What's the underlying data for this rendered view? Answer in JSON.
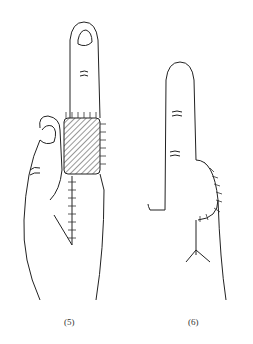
{
  "figure": {
    "panels": [
      {
        "label": "(5)",
        "description": "hand with index finger extended, hatched cross-finger flap sutured at base of finger, sutured donor incision on palm"
      },
      {
        "label": "(6)",
        "description": "hand with index finger extended, healed flap with suture line along side of finger"
      }
    ],
    "colors": {
      "line": "#222222",
      "background": "#ffffff"
    }
  }
}
